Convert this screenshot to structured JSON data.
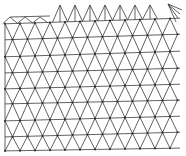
{
  "diagram": {
    "type": "triangular-mesh",
    "width": 186,
    "height": 156,
    "background": "#ffffff",
    "stroke_color": "#3a3a3a",
    "node_color": "#2a2a2a",
    "rows": [
      {
        "y_left": 17,
        "y_right": 12,
        "x_start": 10,
        "x_end": 50
      },
      {
        "y_left": 24,
        "y_right": 18,
        "x_start": 5,
        "x_end": 180
      },
      {
        "y_left": 40,
        "y_right": 34,
        "x_start": 5,
        "x_end": 180
      },
      {
        "y_left": 57,
        "y_right": 51,
        "x_start": 5,
        "x_end": 180
      },
      {
        "y_left": 73,
        "y_right": 68,
        "x_start": 5,
        "x_end": 180
      },
      {
        "y_left": 89,
        "y_right": 84,
        "x_start": 5,
        "x_end": 180
      },
      {
        "y_left": 104,
        "y_right": 100,
        "x_start": 5,
        "x_end": 180
      },
      {
        "y_left": 121,
        "y_right": 116,
        "x_start": 5,
        "x_end": 180
      },
      {
        "y_left": 137,
        "y_right": 132,
        "x_start": 5,
        "x_end": 180
      },
      {
        "y_left": 151,
        "y_right": 148,
        "x_start": 5,
        "x_end": 180
      }
    ],
    "node_spacing_x": 15,
    "top_peaks_x": [
      60,
      75,
      90,
      105,
      120,
      135,
      150
    ]
  }
}
